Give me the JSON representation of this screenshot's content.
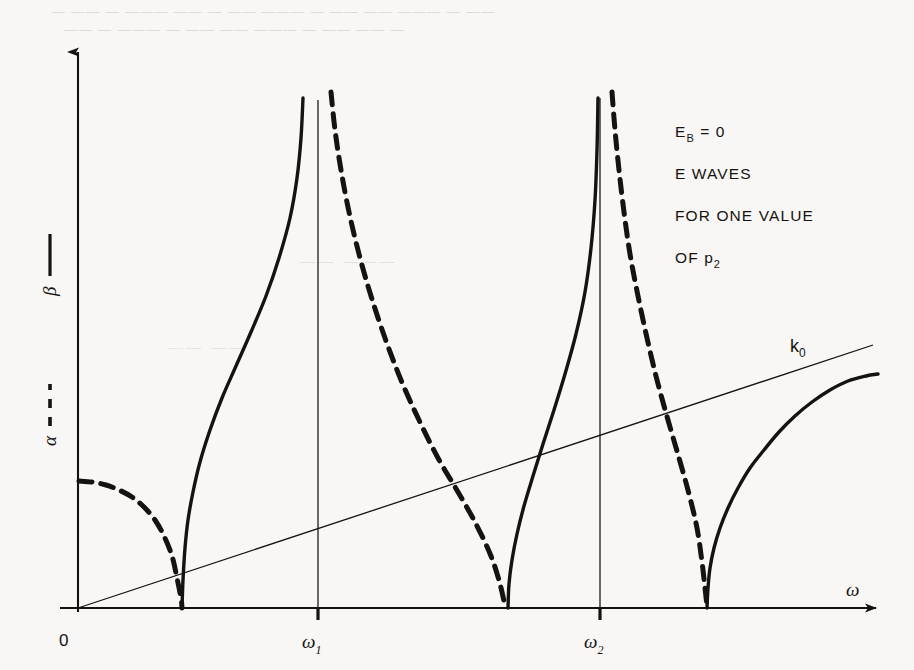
{
  "figure": {
    "background_color": "#f8f7f5",
    "ink_color": "#15120f",
    "origin_label": "0",
    "x_axis": {
      "symbol": "ω",
      "ticks": [
        {
          "label": "ω",
          "sub": "1",
          "x": 318
        },
        {
          "label": "ω",
          "sub": "2",
          "x": 600
        }
      ]
    },
    "y_axis": {
      "legend_solid": {
        "symbol": "β",
        "style": "solid",
        "dash_glyph": "——"
      },
      "legend_dashed": {
        "symbol": "α",
        "style": "dashed",
        "dash_glyph": "- - -"
      }
    },
    "line_label": {
      "text": "k",
      "sub": "0"
    },
    "annotation": {
      "lines": [
        {
          "text": "E",
          "sub": "B",
          "tail": " = 0"
        },
        {
          "text": "E  WAVES",
          "sub": "",
          "tail": ""
        },
        {
          "text": "FOR ONE VALUE",
          "sub": "",
          "tail": ""
        },
        {
          "text": "OF p",
          "sub": "2",
          "tail": ""
        }
      ]
    },
    "bleed_through": {
      "row1": "— —— — ——— —— — —— ——— — —— —— ——— — ——",
      "row2": "—— — ——— — —— —— ——— — —— —— —",
      "mid1": "—— ———",
      "mid2": "—— ——"
    }
  },
  "chart_data": {
    "type": "line",
    "title": "",
    "xlabel": "ω",
    "ylabel": "α, β",
    "grid": false,
    "legend_position": "y-axis",
    "axis_pixel_frame": {
      "origin_x": 78,
      "axis_y": 608,
      "y_axis_top": 45,
      "x_axis_right": 884,
      "plot_top": 92
    },
    "x_tick_values": {
      "omega_1": 318,
      "omega_2": 600
    },
    "resonances_pixel_x": [
      318,
      600
    ],
    "cutoffs_pixel_x": [
      182,
      508,
      707
    ],
    "series": [
      {
        "name": "β (propagation constant)",
        "style": "solid",
        "stroke_width": 3.4,
        "branches": [
          {
            "name": "beta-branch-1",
            "comment": "rises from cutoff 182 asymptotic to omega_1 = 318",
            "points": [
              [
                182,
                608
              ],
              [
                183,
                580
              ],
              [
                185,
                548
              ],
              [
                188,
                520
              ],
              [
                193,
                492
              ],
              [
                200,
                462
              ],
              [
                210,
                430
              ],
              [
                222,
                398
              ],
              [
                236,
                366
              ],
              [
                251,
                332
              ],
              [
                266,
                296
              ],
              [
                279,
                258
              ],
              [
                290,
                218
              ],
              [
                297,
                178
              ],
              [
                301,
                138
              ],
              [
                303,
                98
              ]
            ]
          },
          {
            "name": "beta-branch-2",
            "comment": "rises from cutoff 508 asymptotic to omega_2 = 600",
            "points": [
              [
                508,
                608
              ],
              [
                509,
                584
              ],
              [
                512,
                560
              ],
              [
                517,
                534
              ],
              [
                524,
                506
              ],
              [
                533,
                476
              ],
              [
                543,
                444
              ],
              [
                554,
                410
              ],
              [
                565,
                374
              ],
              [
                576,
                334
              ],
              [
                585,
                292
              ],
              [
                591,
                248
              ],
              [
                595,
                200
              ],
              [
                597,
                150
              ],
              [
                598,
                98
              ]
            ]
          },
          {
            "name": "beta-branch-3",
            "comment": "rises from cutoff 707 toward upper right, above k0",
            "points": [
              [
                707,
                608
              ],
              [
                708,
                588
              ],
              [
                710,
                568
              ],
              [
                714,
                548
              ],
              [
                720,
                528
              ],
              [
                728,
                508
              ],
              [
                738,
                488
              ],
              [
                750,
                468
              ],
              [
                764,
                450
              ],
              [
                779,
                432
              ],
              [
                795,
                416
              ],
              [
                812,
                402
              ],
              [
                830,
                390
              ],
              [
                848,
                381
              ],
              [
                866,
                376
              ],
              [
                878,
                374
              ]
            ]
          }
        ]
      },
      {
        "name": "α (attenuation constant)",
        "style": "dashed",
        "stroke_width": 5.0,
        "dash_pattern": "13 9",
        "branches": [
          {
            "name": "alpha-branch-0",
            "comment": "quarter-circle arc from y-axis at y=481 down to cutoff 182",
            "points": [
              [
                79,
                481
              ],
              [
                92,
                482
              ],
              [
                106,
                485
              ],
              [
                119,
                490
              ],
              [
                132,
                497
              ],
              [
                144,
                507
              ],
              [
                155,
                520
              ],
              [
                164,
                536
              ],
              [
                172,
                556
              ],
              [
                177,
                578
              ],
              [
                181,
                598
              ],
              [
                182,
                608
              ]
            ]
          },
          {
            "name": "alpha-branch-1",
            "comment": "descends from omega_1 asymptote (x=331) to cutoff 508",
            "points": [
              [
                331,
                92
              ],
              [
                335,
                130
              ],
              [
                341,
                170
              ],
              [
                349,
                212
              ],
              [
                359,
                254
              ],
              [
                371,
                296
              ],
              [
                385,
                338
              ],
              [
                401,
                380
              ],
              [
                419,
                420
              ],
              [
                438,
                458
              ],
              [
                458,
                492
              ],
              [
                476,
                524
              ],
              [
                491,
                556
              ],
              [
                500,
                584
              ],
              [
                505,
                606
              ]
            ]
          },
          {
            "name": "alpha-branch-2",
            "comment": "descends from omega_2 asymptote (x=612) to cutoff 707",
            "points": [
              [
                612,
                92
              ],
              [
                615,
                130
              ],
              [
                619,
                170
              ],
              [
                624,
                212
              ],
              [
                630,
                254
              ],
              [
                638,
                296
              ],
              [
                647,
                338
              ],
              [
                657,
                380
              ],
              [
                668,
                420
              ],
              [
                679,
                458
              ],
              [
                689,
                494
              ],
              [
                697,
                528
              ],
              [
                702,
                562
              ],
              [
                705,
                588
              ],
              [
                707,
                606
              ]
            ]
          }
        ]
      },
      {
        "name": "k₀ (free-space wavenumber)",
        "style": "thin-solid",
        "stroke_width": 1.3,
        "branches": [
          {
            "name": "k0-line",
            "comment": "straight line from origin, slope ~0.33 in pixel units",
            "points": [
              [
                78,
                608
              ],
              [
                873,
                345
              ]
            ]
          }
        ]
      }
    ],
    "asymptote_lines": [
      {
        "name": "asymptote-omega-1",
        "x": 318,
        "y_top": 100,
        "y_bottom": 608
      },
      {
        "name": "asymptote-omega-2",
        "x": 600,
        "y_top": 98,
        "y_bottom": 608
      }
    ],
    "annotations": [
      {
        "text": "E_B = 0",
        "x": 675,
        "y": 137
      },
      {
        "text": "E  WAVES",
        "x": 675,
        "y": 179
      },
      {
        "text": "FOR ONE VALUE",
        "x": 675,
        "y": 221
      },
      {
        "text": "OF p_2",
        "x": 675,
        "y": 263
      },
      {
        "text": "k_0",
        "x": 798,
        "y": 351
      }
    ]
  }
}
